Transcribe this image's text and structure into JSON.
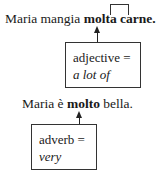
{
  "example1": {
    "prefix": "Maria mangia ",
    "highlight1": "molta",
    "space": " ",
    "highlight2": "carne.",
    "box": {
      "label": "adjective =",
      "meaning": "a lot of"
    }
  },
  "example2": {
    "prefix": "Maria è ",
    "highlight": "molto",
    "suffix": " bella.",
    "box": {
      "label": "adverb =",
      "meaning": "very"
    }
  }
}
